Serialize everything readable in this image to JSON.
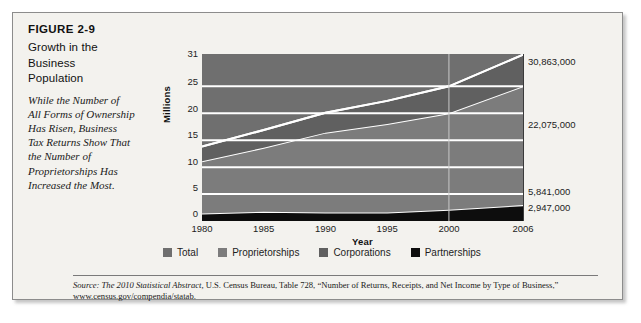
{
  "figure": {
    "number": "FIGURE 2-9",
    "title_lines": [
      "Growth in the",
      "Business",
      "Population"
    ],
    "caption_lines": [
      "While the Number of",
      "All Forms of Ownership",
      "Has Risen, Business",
      "Tax Returns Show That",
      "the Number of",
      "Proprietorships Has",
      "Increased the Most."
    ]
  },
  "source": {
    "prefix": "Source:",
    "italic_title": "The 2010 Statistical Abstract,",
    "rest": "U.S. Census Bureau, Table 728, “Number of Returns, Receipts, and Net Income by Type of Business,” www.census.gov/compendia/statab."
  },
  "legend": {
    "items": [
      {
        "label": "Total",
        "color": "#6f6f6f"
      },
      {
        "label": "Proprietorships",
        "color": "#7c7c7c"
      },
      {
        "label": "Corporations",
        "color": "#606060"
      },
      {
        "label": "Partnerships",
        "color": "#0d0d0d"
      }
    ]
  },
  "chart_data": {
    "type": "area",
    "title": "Growth in the Business Population",
    "xlabel": "Year",
    "ylabel": "Millions",
    "xlim": [
      1980,
      2006
    ],
    "ylim": [
      0,
      31
    ],
    "grid": true,
    "legend_position": "bottom",
    "x_ticks": [
      1980,
      1985,
      1990,
      1995,
      2000,
      2006
    ],
    "y_ticks": [
      0,
      5,
      10,
      15,
      20,
      25,
      31
    ],
    "x": [
      1980,
      1985,
      1990,
      1995,
      2000,
      2006
    ],
    "series": [
      {
        "name": "Partnerships",
        "color": "#0d0d0d",
        "values": [
          1.4,
          1.7,
          1.6,
          1.6,
          2.1,
          2.947
        ]
      },
      {
        "name": "Proprietorships",
        "color": "#7c7c7c",
        "values": [
          9.7,
          11.9,
          14.8,
          16.4,
          17.9,
          22.075
        ]
      },
      {
        "name": "Corporations",
        "color": "#606060",
        "values": [
          2.7,
          3.3,
          3.7,
          4.3,
          5.0,
          5.841
        ]
      },
      {
        "name": "Total",
        "color": "#6f6f6f",
        "values": [
          13.8,
          16.9,
          20.1,
          22.3,
          25.0,
          30.863
        ]
      }
    ],
    "value_labels": [
      {
        "text": "30,863,000",
        "series": "Total",
        "value": 30863000,
        "y_px": 45
      },
      {
        "text": "22,075,000",
        "series": "Proprietorships",
        "value": 22075000,
        "y_px": 108
      },
      {
        "text": "5,841,000",
        "series": "Corporations",
        "value": 5841000,
        "y_px": 175
      },
      {
        "text": "2,947,000",
        "series": "Partnerships",
        "value": 2947000,
        "y_px": 191
      }
    ]
  }
}
